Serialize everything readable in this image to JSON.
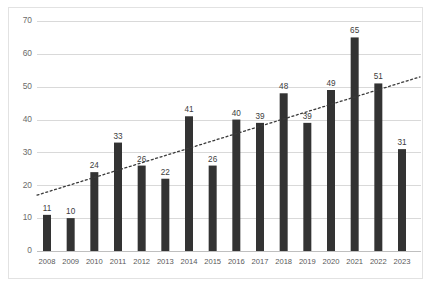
{
  "chart_data": {
    "type": "bar",
    "title": "",
    "subtitle": "",
    "xlabel": "",
    "ylabel": "",
    "categories": [
      "2008",
      "2009",
      "2010",
      "2011",
      "2012",
      "2013",
      "2014",
      "2015",
      "2016",
      "2017",
      "2018",
      "2019",
      "2020",
      "2021",
      "2022",
      "2023"
    ],
    "values": [
      11,
      10,
      24,
      33,
      26,
      22,
      41,
      26,
      40,
      39,
      48,
      39,
      49,
      65,
      51,
      31
    ],
    "data_labels": [
      "11",
      "10",
      "24",
      "33",
      "26",
      "22",
      "41",
      "26",
      "40",
      "39",
      "48",
      "39",
      "49",
      "65",
      "51",
      "31"
    ],
    "ylim": [
      0,
      70
    ],
    "yticks": [
      0,
      10,
      20,
      30,
      40,
      50,
      60,
      70
    ],
    "ytick_labels": [
      "0",
      "10",
      "20",
      "30",
      "40",
      "50",
      "60",
      "70"
    ],
    "grid": true,
    "grid_axis": "y",
    "legend": null,
    "legend_position": "none",
    "series": [
      {
        "name": "",
        "type": "bar",
        "color": "#333333",
        "values": [
          11,
          10,
          24,
          33,
          26,
          22,
          41,
          26,
          40,
          39,
          48,
          39,
          49,
          65,
          51,
          31
        ]
      },
      {
        "name": "",
        "type": "line",
        "style": "dotted",
        "color": "#3a3a3a",
        "start_value": 17.0,
        "end_value": 53.0
      }
    ],
    "annotations": []
  },
  "colors": {
    "bar": "#333333",
    "trendline": "#3a3a3a",
    "gridline": "#d9d9d9",
    "axis": "#bfbfbf",
    "frame_border": "#e2e2e2",
    "background": "#ffffff",
    "ytick_text": "#6b6b6b",
    "xtick_text": "#595959",
    "bar_label_text": "#3d3d3d"
  }
}
